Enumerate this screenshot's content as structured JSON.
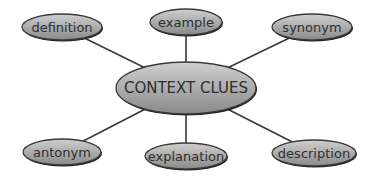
{
  "diagram": {
    "type": "concept-map",
    "center": {
      "label": "CONTEXT CLUES",
      "cx": 186,
      "cy": 88,
      "rx": 70,
      "ry": 26
    },
    "nodes": [
      {
        "label": "definition",
        "cx": 62,
        "cy": 27,
        "rx": 40,
        "ry": 13
      },
      {
        "label": "example",
        "cx": 186,
        "cy": 22,
        "rx": 36,
        "ry": 13
      },
      {
        "label": "synonym",
        "cx": 312,
        "cy": 27,
        "rx": 40,
        "ry": 13
      },
      {
        "label": "antonym",
        "cx": 62,
        "cy": 152,
        "rx": 39,
        "ry": 13
      },
      {
        "label": "explanation",
        "cx": 186,
        "cy": 156,
        "rx": 41,
        "ry": 13
      },
      {
        "label": "description",
        "cx": 314,
        "cy": 153,
        "rx": 42,
        "ry": 13
      }
    ],
    "colors": {
      "fill_light": "#c8c8c8",
      "fill_dark": "#8e8e8e",
      "stroke": "#3a3a3a",
      "text": "#2e2e2e"
    }
  }
}
